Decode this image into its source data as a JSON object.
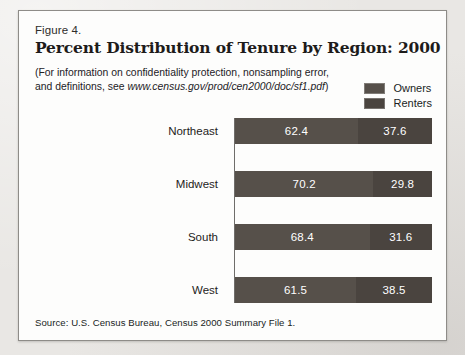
{
  "figure": {
    "number": "Figure 4.",
    "title": "Percent Distribution of Tenure by Region: 2000",
    "note_lead": "(For information on confidentiality protection, nonsampling error, and definitions, see ",
    "note_url": "www.census.gov/prod/cen2000/doc/sf1.pdf",
    "note_tail": ")",
    "source": "Source: U.S. Census Bureau, Census 2000 Summary File 1."
  },
  "legend": {
    "items": [
      {
        "label": "Owners",
        "color": "#56504a"
      },
      {
        "label": "Renters",
        "color": "#4a443f"
      }
    ]
  },
  "chart_data": {
    "type": "bar",
    "orientation": "horizontal",
    "stacked": true,
    "normalized_percent": true,
    "title": "Percent Distribution of Tenure by Region: 2000",
    "xlabel": "",
    "ylabel": "",
    "xlim": [
      0,
      100
    ],
    "grid": false,
    "legend_position": "top-right",
    "categories": [
      "Northeast",
      "Midwest",
      "South",
      "West"
    ],
    "series": [
      {
        "name": "Owners",
        "color": "#56504a",
        "values": [
          62.4,
          70.2,
          68.4,
          61.5
        ]
      },
      {
        "name": "Renters",
        "color": "#4a443f",
        "values": [
          37.6,
          29.8,
          31.6,
          38.5
        ]
      }
    ],
    "value_labels": [
      {
        "category": "Northeast",
        "owners": "62.4",
        "renters": "37.6"
      },
      {
        "category": "Midwest",
        "owners": "70.2",
        "renters": "29.8"
      },
      {
        "category": "South",
        "owners": "68.4",
        "renters": "31.6"
      },
      {
        "category": "West",
        "owners": "61.5",
        "renters": "38.5"
      }
    ]
  }
}
